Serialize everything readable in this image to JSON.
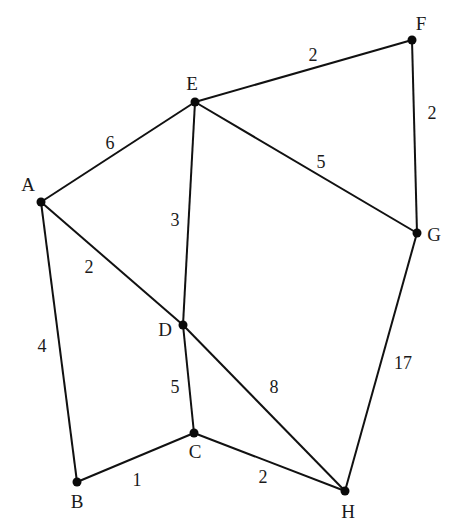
{
  "graph": {
    "style": {
      "edge_color": "#111111",
      "node_color": "#0a0a0a",
      "text_color": "#1a1a1a",
      "background": "#ffffff"
    },
    "nodes": [
      {
        "id": "A",
        "label": "A",
        "x": 41,
        "y": 202,
        "lx": 28,
        "ly": 191
      },
      {
        "id": "B",
        "label": "B",
        "x": 77,
        "y": 482,
        "lx": 77,
        "ly": 508
      },
      {
        "id": "C",
        "label": "C",
        "x": 194,
        "y": 433,
        "lx": 195,
        "ly": 458
      },
      {
        "id": "D",
        "label": "D",
        "x": 183,
        "y": 325,
        "lx": 165,
        "ly": 336
      },
      {
        "id": "E",
        "label": "E",
        "x": 195,
        "y": 102,
        "lx": 192,
        "ly": 90
      },
      {
        "id": "F",
        "label": "F",
        "x": 412,
        "y": 40,
        "lx": 421,
        "ly": 30
      },
      {
        "id": "G",
        "label": "G",
        "x": 417,
        "y": 233,
        "lx": 434,
        "ly": 241
      },
      {
        "id": "H",
        "label": "H",
        "x": 345,
        "y": 491,
        "lx": 348,
        "ly": 518
      }
    ],
    "edges": [
      {
        "from": "A",
        "to": "E",
        "weight": "6",
        "lx": 110,
        "ly": 149
      },
      {
        "from": "E",
        "to": "F",
        "weight": "2",
        "lx": 313,
        "ly": 61
      },
      {
        "from": "F",
        "to": "G",
        "weight": "2",
        "lx": 432,
        "ly": 119
      },
      {
        "from": "E",
        "to": "G",
        "weight": "5",
        "lx": 321,
        "ly": 168
      },
      {
        "from": "E",
        "to": "D",
        "weight": "3",
        "lx": 175,
        "ly": 226
      },
      {
        "from": "A",
        "to": "D",
        "weight": "2",
        "lx": 89,
        "ly": 273
      },
      {
        "from": "A",
        "to": "B",
        "weight": "4",
        "lx": 42,
        "ly": 352
      },
      {
        "from": "D",
        "to": "C",
        "weight": "5",
        "lx": 175,
        "ly": 393
      },
      {
        "from": "D",
        "to": "H",
        "weight": "8",
        "lx": 274,
        "ly": 393
      },
      {
        "from": "G",
        "to": "H",
        "weight": "17",
        "lx": 403,
        "ly": 369
      },
      {
        "from": "B",
        "to": "C",
        "weight": "1",
        "lx": 137,
        "ly": 486
      },
      {
        "from": "C",
        "to": "H",
        "weight": "2",
        "lx": 263,
        "ly": 483
      }
    ]
  }
}
